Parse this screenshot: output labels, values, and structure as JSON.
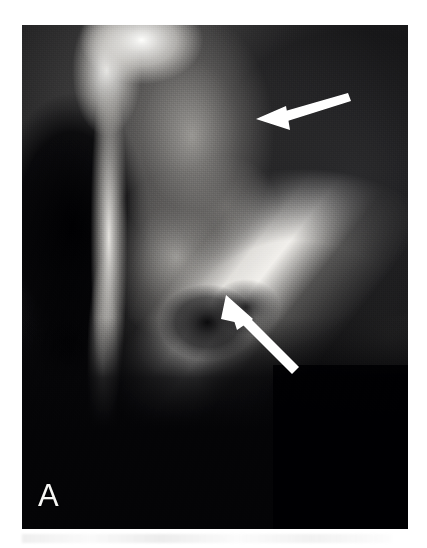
{
  "figure": {
    "panel_label": "A",
    "modality": "radiograph",
    "view": "hip / pelvis oblique radiograph",
    "background_color": "#ffffff",
    "plate_color": "#08080a",
    "annotation_color": "#ffffff"
  },
  "plate": {
    "x": 22,
    "y": 25,
    "width": 386,
    "height": 504
  },
  "annotations": [
    {
      "name": "upper-arrow",
      "icon": "arrow-icon",
      "points_to": "superior lesion / fracture line at femoral head-neck junction",
      "direction": "left-down",
      "tip_x": 234,
      "tip_y": 94,
      "tail_x": 326,
      "tail_y": 68,
      "color": "#ffffff"
    },
    {
      "name": "lower-arrow",
      "icon": "arrow-icon",
      "points_to": "inferior lucent lesion below femoral neck",
      "direction": "up-left",
      "tip_x": 204,
      "tip_y": 270,
      "tail_x": 276,
      "tail_y": 341,
      "color": "#ffffff"
    }
  ],
  "anatomy_regions": [
    {
      "name": "acetabular-roof",
      "label": "bright acetabular roof / ilium",
      "brightness": "high"
    },
    {
      "name": "obturator-foramen",
      "label": "obturator foramen lucency",
      "brightness": "very-low"
    },
    {
      "name": "cortical-column",
      "label": "bright vertical cortical column",
      "brightness": "high"
    },
    {
      "name": "trabecular-body",
      "label": "trabecular femoral head and neck",
      "brightness": "medium"
    },
    {
      "name": "femoral-cortex",
      "label": "bright diagonal femoral cortex band",
      "brightness": "high"
    },
    {
      "name": "fracture-line",
      "label": "dark diagonal fracture / joint line",
      "brightness": "low"
    },
    {
      "name": "lucent-lesion",
      "label": "dark lucent lesion",
      "brightness": "very-low"
    },
    {
      "name": "inferior-field",
      "label": "dark inferior soft-tissue field",
      "brightness": "low"
    },
    {
      "name": "exposure-cut",
      "label": "rectangular exposure cut, lower right",
      "brightness": "very-low"
    }
  ]
}
